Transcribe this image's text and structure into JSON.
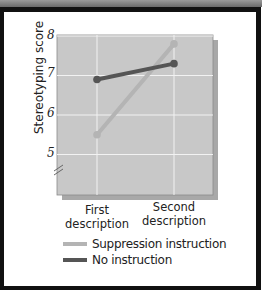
{
  "chart_data": {
    "type": "line",
    "title": "",
    "xlabel": "",
    "ylabel": "Stereotyping score",
    "categories": [
      "First description",
      "Second description"
    ],
    "x_tick_labels": [
      [
        "First",
        "description"
      ],
      [
        "Second",
        "description"
      ]
    ],
    "y_ticks": [
      5,
      6,
      7,
      8
    ],
    "ylim": [
      4.3,
      8
    ],
    "axis_break": true,
    "grid": true,
    "legend_position": "bottom",
    "series": [
      {
        "name": "Suppression instruction",
        "values": [
          5.5,
          7.8
        ],
        "color": "#b4b4b4"
      },
      {
        "name": "No instruction",
        "values": [
          6.9,
          7.3
        ],
        "color": "#555555"
      }
    ]
  },
  "colors": {
    "plot_background": "#c8c8c8",
    "gridline": "#f2f2f2",
    "frame": "#111111",
    "shadow": "#a8a8a8"
  }
}
